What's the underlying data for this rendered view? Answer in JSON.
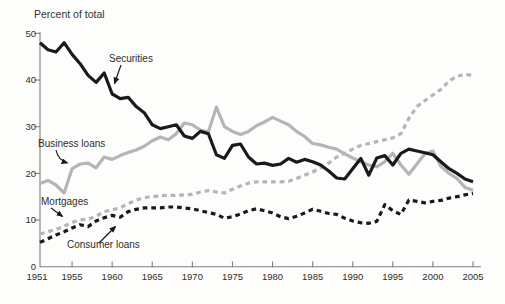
{
  "chart_data": {
    "type": "line",
    "title": "Percent of total",
    "xlabel": "",
    "ylabel": "Percent of total",
    "x_start": 1951,
    "x_end": 2005,
    "xlim": [
      1951,
      2006
    ],
    "ylim": [
      0,
      50
    ],
    "xticks": [
      1955,
      1960,
      1965,
      1970,
      1975,
      1980,
      1985,
      1990,
      1995,
      2000,
      2005
    ],
    "xtick_labels": [
      "1955",
      "1960",
      "1965",
      "1970",
      "1975",
      "1980",
      "1985",
      "1990",
      "1995",
      "2000",
      "2005"
    ],
    "first_xtick_label": "1951",
    "yticks": [
      0,
      10,
      20,
      30,
      40,
      50
    ],
    "grid": false,
    "legend_position": "inline-annotations",
    "colors": {
      "line_black": "#1a1a1a",
      "line_gray": "#b5b5b5",
      "axis": "#808080",
      "text": "#2d2d2d"
    },
    "series": [
      {
        "name": "Securities",
        "color": "#1a1a1a",
        "style": "solid",
        "values": [
          48.0,
          46.5,
          46.0,
          48.0,
          45.5,
          43.5,
          41.0,
          39.5,
          41.5,
          37.0,
          36.0,
          36.3,
          34.3,
          33.0,
          30.4,
          29.6,
          30.0,
          30.4,
          28.0,
          27.5,
          29.0,
          28.5,
          24.0,
          23.2,
          26.0,
          26.3,
          23.5,
          22.0,
          22.2,
          21.7,
          22.0,
          23.2,
          22.4,
          23.0,
          22.5,
          21.8,
          20.5,
          19.0,
          18.8,
          21.0,
          23.2,
          19.6,
          23.3,
          23.8,
          21.8,
          24.3,
          25.2,
          24.8,
          24.4,
          24.0,
          22.5,
          21.0,
          20.0,
          18.8,
          18.2
        ]
      },
      {
        "name": "Business loans",
        "color": "#b5b5b5",
        "style": "solid",
        "values": [
          17.8,
          18.5,
          17.5,
          15.8,
          21.0,
          22.0,
          22.2,
          21.2,
          23.5,
          23.0,
          23.8,
          24.5,
          25.0,
          25.8,
          27.0,
          27.8,
          27.2,
          28.5,
          30.8,
          30.4,
          29.3,
          28.9,
          34.2,
          30.0,
          29.0,
          28.3,
          29.0,
          30.2,
          31.0,
          32.0,
          31.2,
          30.4,
          29.0,
          27.9,
          26.4,
          26.1,
          25.6,
          25.2,
          24.2,
          23.3,
          22.5,
          21.8,
          21.4,
          22.5,
          24.3,
          21.8,
          19.8,
          22.0,
          24.2,
          24.8,
          21.5,
          20.0,
          18.9,
          17.0,
          16.4
        ]
      },
      {
        "name": "Mortgages",
        "color": "#b5b5b5",
        "style": "dashed",
        "values": [
          7.0,
          7.5,
          8.0,
          8.7,
          9.5,
          10.0,
          10.2,
          10.8,
          11.8,
          12.2,
          12.6,
          13.5,
          14.3,
          14.8,
          15.0,
          15.2,
          15.3,
          15.3,
          15.4,
          15.5,
          16.0,
          16.3,
          16.0,
          15.8,
          16.6,
          17.3,
          17.9,
          18.2,
          18.2,
          18.2,
          18.2,
          18.3,
          18.9,
          19.6,
          20.3,
          21.2,
          22.2,
          23.5,
          24.3,
          25.2,
          26.0,
          26.4,
          26.8,
          27.2,
          27.6,
          28.5,
          31.8,
          34.3,
          35.6,
          36.8,
          38.0,
          39.8,
          40.8,
          41.2,
          41.0
        ]
      },
      {
        "name": "Consumer loans",
        "color": "#1a1a1a",
        "style": "dashed",
        "values": [
          5.2,
          6.0,
          6.8,
          7.5,
          8.3,
          9.0,
          8.6,
          9.8,
          10.5,
          11.0,
          10.6,
          11.8,
          12.3,
          12.6,
          12.6,
          12.6,
          12.8,
          12.8,
          12.6,
          12.4,
          12.0,
          11.6,
          11.2,
          10.4,
          10.7,
          11.3,
          12.0,
          12.4,
          12.0,
          11.5,
          10.7,
          10.3,
          10.8,
          11.5,
          12.3,
          11.9,
          11.4,
          11.2,
          10.4,
          9.8,
          9.4,
          9.3,
          9.7,
          13.3,
          12.0,
          11.2,
          14.3,
          14.0,
          13.7,
          14.0,
          14.2,
          14.7,
          15.0,
          15.4,
          15.7
        ]
      }
    ],
    "annotations": [
      {
        "id": "securities",
        "label": "Securities",
        "text_left": 109,
        "text_top": 53,
        "arrow": {
          "from": [
            121,
            65
          ],
          "to": [
            114.5,
            83.5
          ]
        }
      },
      {
        "id": "business-loans",
        "label": "Business loans",
        "text_left": 38,
        "text_top": 138,
        "arrow": {
          "from": [
            56,
            150
          ],
          "to": [
            67.5,
            163
          ],
          "bend": [
            58,
            160
          ]
        }
      },
      {
        "id": "mortgages",
        "label": "Mortgages",
        "text_left": 41,
        "text_top": 196,
        "arrow": {
          "from": [
            51,
            208
          ],
          "to": [
            62.5,
            216.5
          ]
        }
      },
      {
        "id": "consumer-loans",
        "label": "Consumer loans",
        "text_left": 67,
        "text_top": 239,
        "arrow": {
          "from": [
            99,
            243
          ],
          "to": [
            115.5,
            226.5
          ]
        }
      }
    ],
    "layout": {
      "x0": 40,
      "px_per_year": 8.019,
      "y_base": 266.7,
      "px_per_unit": 4.667,
      "plot_top": 32,
      "axis_right": 481,
      "xtick_label_y": 280,
      "line_width": 3.2,
      "dash_pattern": "4.7 3.9"
    }
  }
}
